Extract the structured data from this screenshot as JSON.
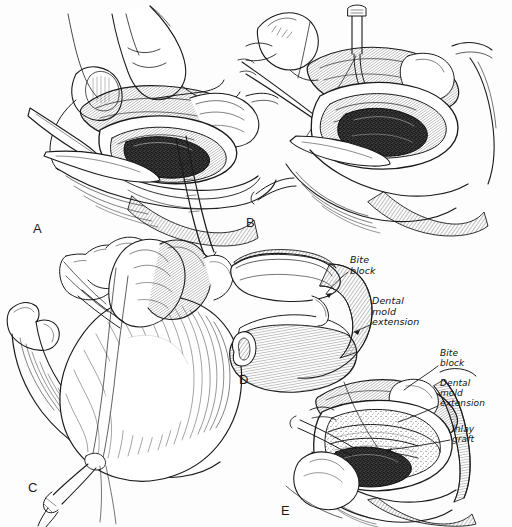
{
  "figure": {
    "medium": "pen-and-ink line drawing with stipple and hatch shading",
    "background_color": "#fdfdfd",
    "ink_color": "#1a1a1a",
    "width": 512,
    "height": 527
  },
  "panels": [
    {
      "id": "A",
      "letter": "A",
      "letter_x": 33,
      "letter_y": 222,
      "caption_internal": "",
      "description": "Surgeon's gloved fingers retract the lower lip while a scalpel and a hemostat expose the labial vestibule; dark stippled incision in the depth of the sulcus."
    },
    {
      "id": "B",
      "letter": "B",
      "letter_x": 246,
      "letter_y": 216,
      "caption_internal": "",
      "description": "A straight needle on a holder passes a suture through the vestibule; forceps grasp the mucosal edge as the periosteum is elevated."
    },
    {
      "id": "C",
      "letter": "C",
      "letter_x": 28,
      "letter_y": 481,
      "caption_internal": "",
      "description": "Lateral view of the mandible with the dental mold seated; the suture is drawn extraorally and tied over a button with a hemostat."
    },
    {
      "id": "D",
      "letter": "D",
      "letter_x": 239,
      "letter_y": 373,
      "caption_internal": "",
      "description": "The U-shaped acrylic dental mold shown out of the mouth with its bite block and flange-like mold extension."
    },
    {
      "id": "E",
      "letter": "E",
      "letter_x": 281,
      "letter_y": 504,
      "caption_internal": "",
      "description": "The mold in place intraorally; the split-thickness inlay graft is held against the raw periosteal bed by the mold extension."
    }
  ],
  "callouts": [
    {
      "panel": "D",
      "text": "Bite\nblock",
      "x": 350,
      "y": 255,
      "leader_from": [
        348,
        271
      ],
      "leader_to": [
        330,
        290
      ]
    },
    {
      "panel": "D",
      "text": "Dental\nmold\nextension",
      "x": 372,
      "y": 296,
      "leader_from": [
        370,
        322
      ],
      "leader_to": [
        352,
        330
      ]
    },
    {
      "panel": "E",
      "text": "Bite\nblock",
      "x": 440,
      "y": 348,
      "leader_from": [
        438,
        364
      ],
      "leader_to": [
        405,
        388
      ]
    },
    {
      "panel": "E",
      "text": "Dental\nmold\nextension",
      "x": 440,
      "y": 378,
      "leader_from": [
        438,
        403
      ],
      "leader_to": [
        398,
        418
      ]
    },
    {
      "panel": "E",
      "text": "Inlay\ngraft",
      "x": 452,
      "y": 424,
      "leader_from": [
        450,
        439
      ],
      "leader_to": [
        388,
        448
      ]
    }
  ]
}
